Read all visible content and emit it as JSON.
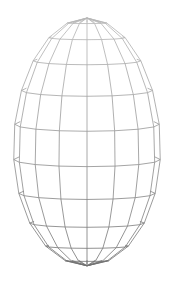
{
  "figure": {
    "background": "#ffffff",
    "line_color_top": "#b8b8b8",
    "line_color_bottom": "#6e6e6e",
    "center_x": 87,
    "apex_y": 18,
    "bottom_y": 272,
    "equator_y": 140,
    "radius_x": 70,
    "meridians": 16,
    "parallels": 11,
    "tilt_view": 0.28
  }
}
